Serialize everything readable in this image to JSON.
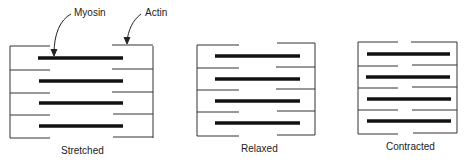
{
  "figure": {
    "annotations": {
      "myosin": "Myosin",
      "actin": "Actin"
    },
    "panels": [
      {
        "id": "stretched",
        "label": "Stretched"
      },
      {
        "id": "relaxed",
        "label": "Relaxed"
      },
      {
        "id": "contracted",
        "label": "Contracted"
      }
    ]
  },
  "colors": {
    "line": "#333333",
    "myosin": "#111111",
    "background": "#ffffff"
  }
}
